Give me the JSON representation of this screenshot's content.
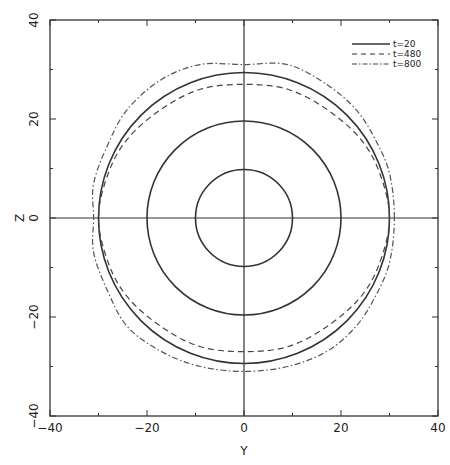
{
  "chart_data": {
    "type": "line",
    "title": "",
    "xlabel": "Y",
    "ylabel": "Z",
    "xlim": [
      -40,
      40
    ],
    "ylim": [
      -40,
      40
    ],
    "xticks": [
      -40,
      -20,
      0,
      20,
      40
    ],
    "yticks": [
      -40,
      -20,
      0,
      20,
      40
    ],
    "minor_ticks_step": 10,
    "grid": false,
    "zero_lines": true,
    "legend_position": "upper right",
    "series": [
      {
        "name": "t=20",
        "style": "solid",
        "contours": [
          {
            "shape": "circle",
            "radius": 10
          },
          {
            "shape": "circle",
            "radius": 20
          },
          {
            "shape": "circle",
            "radius": 30
          }
        ]
      },
      {
        "name": "t=480",
        "style": "dashed",
        "contours": [
          {
            "shape": "closed-curve",
            "points": [
              [
                30,
                0
              ],
              [
                28,
                9
              ],
              [
                24,
                16
              ],
              [
                17,
                22
              ],
              [
                9,
                26
              ],
              [
                0,
                27
              ],
              [
                -9,
                26
              ],
              [
                -17,
                22
              ],
              [
                -24,
                16
              ],
              [
                -28,
                9
              ],
              [
                -30,
                0
              ],
              [
                -28,
                -9
              ],
              [
                -24,
                -16
              ],
              [
                -17,
                -22
              ],
              [
                -9,
                -26
              ],
              [
                0,
                -27
              ],
              [
                9,
                -26
              ],
              [
                17,
                -22
              ],
              [
                24,
                -16
              ],
              [
                28,
                -9
              ]
            ]
          }
        ]
      },
      {
        "name": "t=800",
        "style": "dash-dot",
        "contours": [
          {
            "shape": "closed-curve",
            "points": [
              [
                31,
                0
              ],
              [
                30,
                9
              ],
              [
                27,
                16
              ],
              [
                23,
                22
              ],
              [
                17,
                27
              ],
              [
                9,
                31
              ],
              [
                0,
                31
              ],
              [
                -9,
                31
              ],
              [
                -17,
                28
              ],
              [
                -24,
                22
              ],
              [
                -28,
                15
              ],
              [
                -31,
                7
              ],
              [
                -31,
                0
              ],
              [
                -31,
                -7
              ],
              [
                -28,
                -15
              ],
              [
                -24,
                -22
              ],
              [
                -17,
                -27
              ],
              [
                -9,
                -30
              ],
              [
                0,
                -31
              ],
              [
                9,
                -30
              ],
              [
                17,
                -27
              ],
              [
                23,
                -22
              ],
              [
                27,
                -16
              ],
              [
                30,
                -9
              ]
            ]
          }
        ]
      }
    ]
  },
  "axes": {
    "x_label": "Y",
    "y_label": "Z",
    "x_tick_labels": [
      "−40",
      "−20",
      "0",
      "20",
      "40"
    ],
    "y_tick_labels": [
      "−40",
      "−20",
      "0",
      "20",
      "40"
    ]
  },
  "legend": {
    "items": [
      {
        "label": "t=20",
        "style": "solid"
      },
      {
        "label": "t=480",
        "style": "dashed"
      },
      {
        "label": "t=800",
        "style": "dash-dot"
      }
    ]
  }
}
